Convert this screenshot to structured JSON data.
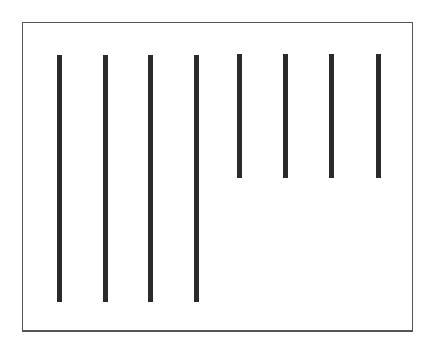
{
  "figure": {
    "frame_color": "#555555",
    "line_color": "#2b2b2b"
  },
  "lines": [
    {
      "x": 57,
      "top": 55,
      "bottom": 302,
      "length": "long"
    },
    {
      "x": 103,
      "top": 55,
      "bottom": 302,
      "length": "long"
    },
    {
      "x": 148,
      "top": 55,
      "bottom": 302,
      "length": "long"
    },
    {
      "x": 194,
      "top": 55,
      "bottom": 302,
      "length": "long"
    },
    {
      "x": 237,
      "top": 54,
      "bottom": 178,
      "length": "short"
    },
    {
      "x": 283,
      "top": 54,
      "bottom": 178,
      "length": "short"
    },
    {
      "x": 329,
      "top": 54,
      "bottom": 178,
      "length": "short"
    },
    {
      "x": 376,
      "top": 54,
      "bottom": 178,
      "length": "short"
    }
  ]
}
